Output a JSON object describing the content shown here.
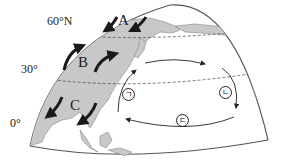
{
  "latitudes": {
    "lat60": "60°N",
    "lat30": "30°",
    "lat0": "0°"
  },
  "wind_labels": {
    "a": "A",
    "b": "B",
    "c": "C"
  },
  "current_labels": {
    "g": "ㄱ",
    "n": "ㄴ",
    "d": "ㄷ"
  },
  "colors": {
    "land": "#c8c8c8",
    "ocean": "#ffffff",
    "outline": "#555555",
    "arrow": "#1a1a1a"
  }
}
